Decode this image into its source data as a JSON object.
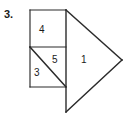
{
  "figure": {
    "problem_number": "3.",
    "canvas": {
      "width": 126,
      "height": 121
    },
    "stroke_color": "#2b2b2b",
    "fill_color": "#ffffff",
    "background_color": "#ffffff",
    "label_color": "#1a1a1a",
    "pieces": [
      {
        "id": "piece-4",
        "label": "4",
        "shape": "rectangle",
        "points": "30,10 66,10 66,47 30,47",
        "label_x": 39,
        "label_y": 25
      },
      {
        "id": "piece-5",
        "label": "5",
        "shape": "triangle",
        "points": "30,47 66,47 66,87",
        "label_x": 52,
        "label_y": 55
      },
      {
        "id": "piece-3",
        "label": "3",
        "shape": "triangle",
        "points": "30,47 66,87 30,87",
        "label_x": 34,
        "label_y": 68
      },
      {
        "id": "piece-1",
        "label": "1",
        "shape": "triangle",
        "points": "66,10 122,60 66,112",
        "label_x": 81,
        "label_y": 55
      }
    ],
    "edges": [
      {
        "id": "rect-top",
        "x1": 30,
        "y1": 10,
        "x2": 66,
        "y2": 10
      },
      {
        "id": "rect-left-upper",
        "x1": 30,
        "y1": 10,
        "x2": 30,
        "y2": 47
      },
      {
        "id": "rect-left-lower",
        "x1": 30,
        "y1": 47,
        "x2": 30,
        "y2": 87
      },
      {
        "id": "square-bottom",
        "x1": 30,
        "y1": 87,
        "x2": 66,
        "y2": 87
      },
      {
        "id": "middle-divider",
        "x1": 30,
        "y1": 47,
        "x2": 66,
        "y2": 47
      },
      {
        "id": "square-diagonal",
        "x1": 30,
        "y1": 47,
        "x2": 66,
        "y2": 87
      },
      {
        "id": "spine-vertical",
        "x1": 66,
        "y1": 10,
        "x2": 66,
        "y2": 112
      },
      {
        "id": "tri-upper-slope",
        "x1": 66,
        "y1": 10,
        "x2": 122,
        "y2": 60
      },
      {
        "id": "tri-lower-slope",
        "x1": 122,
        "y1": 60,
        "x2": 66,
        "y2": 112
      }
    ]
  }
}
